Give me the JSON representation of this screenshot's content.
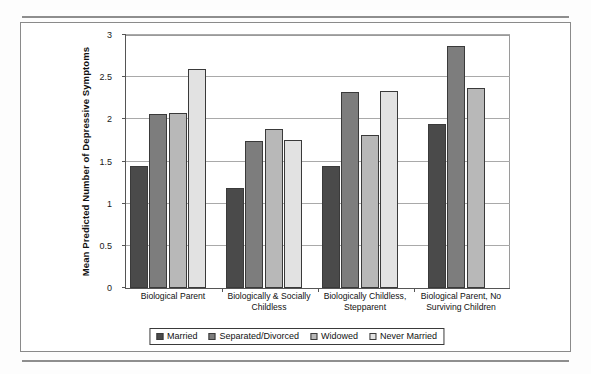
{
  "document": {
    "running_head": ""
  },
  "chart_data": {
    "type": "bar",
    "title": "",
    "xlabel": "",
    "ylabel": "Mean Predicted Number of Depressive Symptoms",
    "ylim": [
      0,
      3
    ],
    "ytick_labels": [
      "0",
      "0.5",
      "1",
      "1.5",
      "2",
      "2.5",
      "3"
    ],
    "ytick_values": [
      0,
      0.5,
      1,
      1.5,
      2,
      2.5,
      3
    ],
    "grid": true,
    "legend_position": "bottom",
    "categories": [
      "Biological Parent",
      "Biologically & Socially Childless",
      "Biologically Childless, Stepparent",
      "Biological Parent, No Surviving Children"
    ],
    "series": [
      {
        "name": "Married",
        "color": "#4a4a4a",
        "values": [
          1.45,
          1.19,
          1.45,
          1.94
        ]
      },
      {
        "name": "Separated/Divorced",
        "color": "#7d7d7d",
        "values": [
          2.06,
          1.74,
          2.32,
          2.87
        ]
      },
      {
        "name": "Widowed",
        "color": "#b8b8b8",
        "values": [
          2.08,
          1.89,
          1.81,
          2.37
        ]
      },
      {
        "name": "Never Married",
        "color": "#e2e2e2",
        "values": [
          2.6,
          1.75,
          2.34,
          null
        ]
      }
    ]
  }
}
